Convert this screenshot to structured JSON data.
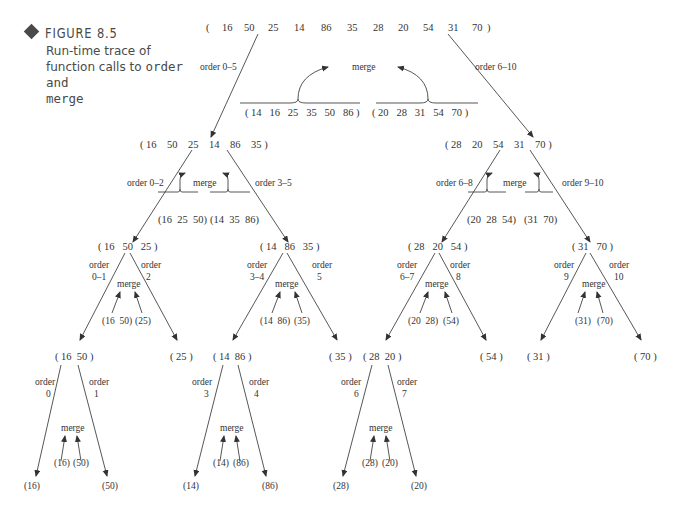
{
  "caption": {
    "figure_label": "FIGURE 8.5",
    "text_before": "Run-time trace of function calls to ",
    "code1": "order",
    "text_mid": " and ",
    "code2": "merge"
  },
  "colors": {
    "ink": "#333333",
    "caption": "#4a4a4a",
    "background": "#ffffff"
  },
  "tree": {
    "root": {
      "list": [
        "16",
        "50",
        "25",
        "14",
        "86",
        "35",
        "28",
        "20",
        "54",
        "31",
        "70"
      ]
    },
    "level1": {
      "left_label": "order 0–5",
      "right_label": "order 6–10",
      "merge_label": "merge",
      "merge_left": "( 14   16   25   35   50   86 )",
      "merge_right": "( 20   28   31   54   70 )",
      "left_node": "( 16    50    25    14    86    35 )",
      "right_node": "( 28    20    54    31    70 )"
    },
    "level2_left": {
      "left_label": "order 0–2",
      "right_label": "order 3–5",
      "merge_label": "merge",
      "merge_left": "(16  25  50)",
      "merge_right": "(14  35  86)",
      "left_node": "( 16   50   25 )",
      "right_node": "( 14   86   35 )"
    },
    "level2_right": {
      "left_label": "order 6–8",
      "right_label": "order 9–10",
      "merge_label": "merge",
      "merge_left": "(20  28  54)",
      "merge_right": "(31  70)",
      "left_node": "( 28   20   54 )",
      "right_node": "( 31   70 )"
    },
    "level3": [
      {
        "label_l1": "order",
        "label_l2": "0–1",
        "label_r1": "order",
        "label_r2": "2",
        "merge_label": "merge",
        "merge_a": "(16  50)",
        "merge_b": "(25)",
        "left_node": "( 16  50 )",
        "right_node": "( 25 )"
      },
      {
        "label_l1": "order",
        "label_l2": "3–4",
        "label_r1": "order",
        "label_r2": "5",
        "merge_label": "merge",
        "merge_a": "(14  86)",
        "merge_b": "(35)",
        "left_node": "( 14  86 )",
        "right_node": "( 35 )"
      },
      {
        "label_l1": "order",
        "label_l2": "6–7",
        "label_r1": "order",
        "label_r2": "8",
        "merge_label": "merge",
        "merge_a": "(20  28)",
        "merge_b": "(54)",
        "left_node": "( 28  20 )",
        "right_node": "( 54 )"
      },
      {
        "label_l1": "order",
        "label_l2": "9",
        "label_r1": "order",
        "label_r2": "10",
        "merge_label": "merge",
        "merge_a": "(31)",
        "merge_b": "(70)",
        "left_node": "( 31 )",
        "right_node": "( 70 )"
      }
    ],
    "level4": [
      {
        "label_l1": "order",
        "label_l2": "0",
        "label_r1": "order",
        "label_r2": "1",
        "merge_label": "merge",
        "merge_a": "(16)",
        "merge_b": "(50)",
        "left_node": "(16)",
        "right_node": "(50)"
      },
      {
        "label_l1": "order",
        "label_l2": "3",
        "label_r1": "order",
        "label_r2": "4",
        "merge_label": "merge",
        "merge_a": "(14)",
        "merge_b": "(86)",
        "left_node": "(14)",
        "right_node": "(86)"
      },
      {
        "label_l1": "order",
        "label_l2": "6",
        "label_r1": "order",
        "label_r2": "7",
        "merge_label": "merge",
        "merge_a": "(28)",
        "merge_b": "(20)",
        "left_node": "(28)",
        "right_node": "(20)"
      }
    ]
  }
}
